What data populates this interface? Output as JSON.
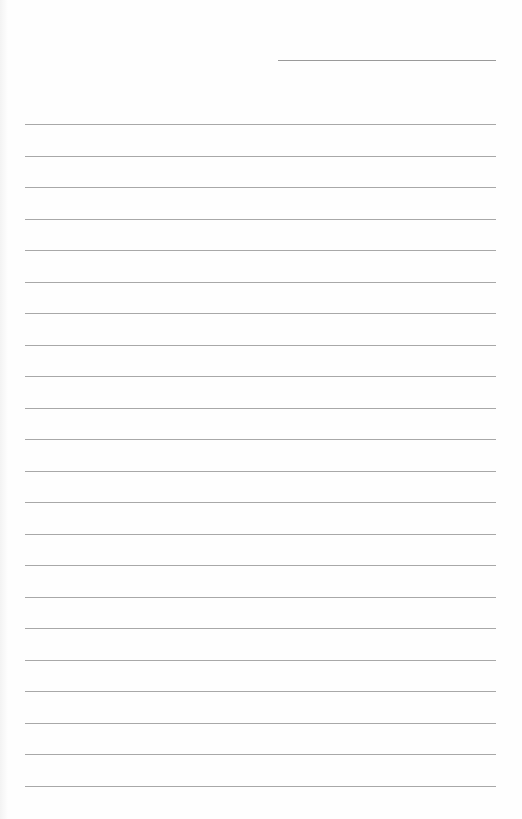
{
  "document": {
    "type": "lined-paper",
    "background": "#fefefe",
    "line_color": "#a8a8a8",
    "header_line": {
      "x": 278,
      "y": 60,
      "width": 218
    },
    "rules": {
      "count": 22,
      "x": 25,
      "width": 471,
      "first_y": 124,
      "spacing": 31.5
    }
  }
}
